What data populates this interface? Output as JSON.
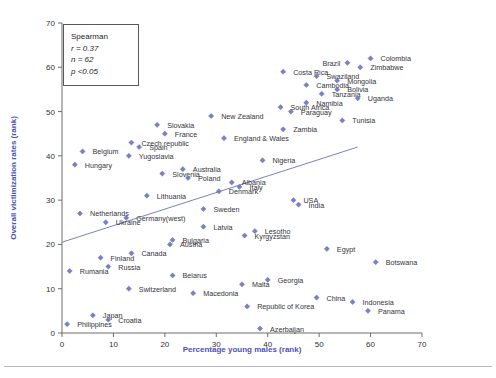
{
  "figure": {
    "marker_color": "#7b80c6",
    "axis_title_color": "#4b51b5",
    "trendline_color": "#7b80c6"
  },
  "stats_box": {
    "title": "Spearman",
    "r": "r = 0.37",
    "n": "n = 62",
    "p": "p <0.05"
  },
  "chart_data": {
    "type": "scatter",
    "title": "",
    "xlabel": "Percentage young males (rank)",
    "ylabel": "Overall victimization rates (rank)",
    "xlim": [
      0,
      70
    ],
    "ylim": [
      0,
      70
    ],
    "xticks": [
      0,
      10,
      20,
      30,
      40,
      50,
      60,
      70
    ],
    "yticks": [
      0,
      10,
      20,
      30,
      40,
      50,
      60,
      70
    ],
    "grid": false,
    "legend": "none",
    "annotations": [
      "Spearman",
      "r = 0.37",
      "n = 62",
      "p <0.05"
    ],
    "trendline": {
      "x0": 0,
      "y0": 20.5,
      "x1": 57.5,
      "y1": 42.0
    },
    "points": [
      {
        "label": "Colombia",
        "x": 60.0,
        "y": 62.0,
        "lx": 10,
        "ly": 3
      },
      {
        "label": "Brazil",
        "x": 55.5,
        "y": 61.0,
        "lx": -25,
        "ly": 3
      },
      {
        "label": "Zimbabwe",
        "x": 58.0,
        "y": 60.0,
        "lx": 10,
        "ly": 3
      },
      {
        "label": "Costa Rica",
        "x": 43.0,
        "y": 59.0,
        "lx": 10,
        "ly": 3
      },
      {
        "label": "Swaziland",
        "x": 49.5,
        "y": 58.0,
        "lx": 10,
        "ly": 3
      },
      {
        "label": "Mongolia",
        "x": 53.5,
        "y": 57.0,
        "lx": 10,
        "ly": 3
      },
      {
        "label": "Cambodia",
        "x": 47.5,
        "y": 56.0,
        "lx": 10,
        "ly": 3
      },
      {
        "label": "Bolivia",
        "x": 53.5,
        "y": 55.0,
        "lx": 10,
        "ly": 3
      },
      {
        "label": "Tanzania",
        "x": 50.5,
        "y": 54.0,
        "lx": 10,
        "ly": 3
      },
      {
        "label": "Uganda",
        "x": 57.5,
        "y": 53.0,
        "lx": 10,
        "ly": 3
      },
      {
        "label": "Namibia",
        "x": 47.5,
        "y": 52.0,
        "lx": 10,
        "ly": 3
      },
      {
        "label": "South Africa",
        "x": 42.5,
        "y": 51.0,
        "lx": 10,
        "ly": 3
      },
      {
        "label": "Paraguay",
        "x": 44.5,
        "y": 50.0,
        "lx": 10,
        "ly": 3
      },
      {
        "label": "New Zealand",
        "x": 29.0,
        "y": 49.0,
        "lx": 10,
        "ly": 3
      },
      {
        "label": "Tunisia",
        "x": 54.5,
        "y": 48.0,
        "lx": 10,
        "ly": 3
      },
      {
        "label": "Slovakia",
        "x": 18.5,
        "y": 47.0,
        "lx": 10,
        "ly": 3
      },
      {
        "label": "Zambia",
        "x": 43.0,
        "y": 46.0,
        "lx": 10,
        "ly": 3
      },
      {
        "label": "France",
        "x": 20.0,
        "y": 45.0,
        "lx": 10,
        "ly": 3
      },
      {
        "label": "England & Wales",
        "x": 31.5,
        "y": 44.0,
        "lx": 10,
        "ly": 3
      },
      {
        "label": "Czech republic",
        "x": 13.5,
        "y": 43.0,
        "lx": 10,
        "ly": 3
      },
      {
        "label": "Spain",
        "x": 15.0,
        "y": 42.0,
        "lx": 10,
        "ly": 3
      },
      {
        "label": "Belgium",
        "x": 4.0,
        "y": 41.0,
        "lx": 10,
        "ly": 3
      },
      {
        "label": "Yugoslavia",
        "x": 13.0,
        "y": 40.0,
        "lx": 10,
        "ly": 3
      },
      {
        "label": "Nigeria",
        "x": 39.0,
        "y": 39.0,
        "lx": 10,
        "ly": 3
      },
      {
        "label": "Hungary",
        "x": 2.5,
        "y": 38.0,
        "lx": 10,
        "ly": 3
      },
      {
        "label": "Australia",
        "x": 23.5,
        "y": 37.0,
        "lx": 10,
        "ly": 3
      },
      {
        "label": "Slovenia",
        "x": 19.5,
        "y": 36.0,
        "lx": 10,
        "ly": 3
      },
      {
        "label": "Poland",
        "x": 24.5,
        "y": 35.0,
        "lx": 10,
        "ly": 3
      },
      {
        "label": "Albania",
        "x": 33.0,
        "y": 34.0,
        "lx": 10,
        "ly": 3
      },
      {
        "label": "Italy",
        "x": 34.5,
        "y": 33.0,
        "lx": 10,
        "ly": 3
      },
      {
        "label": "Denmark",
        "x": 30.5,
        "y": 32.0,
        "lx": 10,
        "ly": 3
      },
      {
        "label": "Lithuania",
        "x": 16.5,
        "y": 31.0,
        "lx": 10,
        "ly": 3
      },
      {
        "label": "USA",
        "x": 45.0,
        "y": 30.0,
        "lx": 10,
        "ly": 3
      },
      {
        "label": "India",
        "x": 46.0,
        "y": 29.0,
        "lx": 10,
        "ly": 3
      },
      {
        "label": "Sweden",
        "x": 27.5,
        "y": 28.0,
        "lx": 10,
        "ly": 3
      },
      {
        "label": "Netherlands",
        "x": 3.5,
        "y": 27.0,
        "lx": 10,
        "ly": 3
      },
      {
        "label": "Germany(west)",
        "x": 12.5,
        "y": 26.0,
        "lx": 10,
        "ly": 3
      },
      {
        "label": "Ukraine",
        "x": 8.5,
        "y": 25.0,
        "lx": 10,
        "ly": 3
      },
      {
        "label": "Latvia",
        "x": 27.5,
        "y": 24.0,
        "lx": 10,
        "ly": 3
      },
      {
        "label": "Lesotho",
        "x": 37.5,
        "y": 23.0,
        "lx": 10,
        "ly": 3
      },
      {
        "label": "Kyrgyzstan",
        "x": 35.5,
        "y": 22.0,
        "lx": 10,
        "ly": 3
      },
      {
        "label": "Bulgaria",
        "x": 21.5,
        "y": 21.0,
        "lx": 10,
        "ly": 3
      },
      {
        "label": "Austria",
        "x": 21.0,
        "y": 20.0,
        "lx": 10,
        "ly": 3
      },
      {
        "label": "Egypt",
        "x": 51.5,
        "y": 19.0,
        "lx": 10,
        "ly": 3
      },
      {
        "label": "Canada",
        "x": 13.5,
        "y": 18.0,
        "lx": 10,
        "ly": 3
      },
      {
        "label": "Finland",
        "x": 7.5,
        "y": 17.0,
        "lx": 10,
        "ly": 3
      },
      {
        "label": "Botswana",
        "x": 61.0,
        "y": 16.0,
        "lx": 10,
        "ly": 3
      },
      {
        "label": "Russia",
        "x": 9.0,
        "y": 15.0,
        "lx": 10,
        "ly": 3
      },
      {
        "label": "Rumania",
        "x": 1.5,
        "y": 14.0,
        "lx": 10,
        "ly": 3
      },
      {
        "label": "Belarus",
        "x": 21.5,
        "y": 13.0,
        "lx": 10,
        "ly": 3
      },
      {
        "label": "Georgia",
        "x": 40.0,
        "y": 12.0,
        "lx": 10,
        "ly": 3
      },
      {
        "label": "Malta",
        "x": 35.0,
        "y": 11.0,
        "lx": 10,
        "ly": 3
      },
      {
        "label": "Switzerland",
        "x": 13.0,
        "y": 10.0,
        "lx": 10,
        "ly": 3
      },
      {
        "label": "Macedonia",
        "x": 25.5,
        "y": 9.0,
        "lx": 10,
        "ly": 3
      },
      {
        "label": "China",
        "x": 49.5,
        "y": 8.0,
        "lx": 10,
        "ly": 3
      },
      {
        "label": "Indonesia",
        "x": 56.5,
        "y": 7.0,
        "lx": 10,
        "ly": 3
      },
      {
        "label": "Republic of Korea",
        "x": 36.0,
        "y": 6.0,
        "lx": 10,
        "ly": 3
      },
      {
        "label": "Panama",
        "x": 59.5,
        "y": 5.0,
        "lx": 10,
        "ly": 3
      },
      {
        "label": "Japan",
        "x": 6.0,
        "y": 4.0,
        "lx": 10,
        "ly": 3
      },
      {
        "label": "Croatia",
        "x": 9.0,
        "y": 3.0,
        "lx": 10,
        "ly": 3
      },
      {
        "label": "Philippines",
        "x": 1.0,
        "y": 2.0,
        "lx": 10,
        "ly": 3
      },
      {
        "label": "Azerbaijan",
        "x": 38.5,
        "y": 1.0,
        "lx": 10,
        "ly": 3
      }
    ]
  }
}
